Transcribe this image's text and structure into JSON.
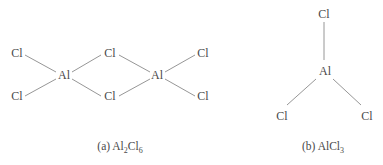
{
  "diagram_a": {
    "caption_prefix": "(a) ",
    "formula": [
      {
        "text": "Al",
        "sub": "2"
      },
      {
        "text": "Cl",
        "sub": "6"
      }
    ],
    "atoms": {
      "cl_term_tl": "Cl",
      "cl_term_bl": "Cl",
      "al_1": "Al",
      "cl_bridge_top": "Cl",
      "cl_bridge_bottom": "Cl",
      "al_2": "Al",
      "cl_term_tr": "Cl",
      "cl_term_br": "Cl"
    }
  },
  "diagram_b": {
    "caption_prefix": "(b) ",
    "formula": [
      {
        "text": "AlCl",
        "sub": "3"
      }
    ],
    "atoms": {
      "cl_top": "Cl",
      "al": "Al",
      "cl_bottom_left": "Cl",
      "cl_bottom_right": "Cl"
    }
  },
  "colors": {
    "text": "#4a4a4a",
    "bond": "#8a8a8a",
    "background": "#ffffff"
  }
}
